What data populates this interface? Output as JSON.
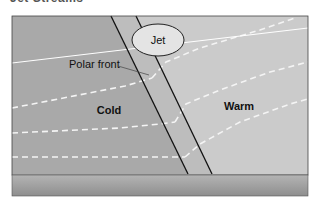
{
  "figure": {
    "cut_title": "Jet Streams",
    "labels": {
      "jet": "Jet",
      "polar_front": "Polar front",
      "cold": "Cold",
      "warm": "Warm"
    },
    "colors": {
      "cold_air": "#a6a6a6",
      "front_zone": "#bcbcbc",
      "warm_air": "#cbcbcb",
      "ground_top": "#b0b0b0",
      "ground_bottom": "#8c8c8c",
      "jet_fill": "#e6e6e6",
      "lines": "#111111",
      "isotherms": "#f2f2f2"
    }
  }
}
